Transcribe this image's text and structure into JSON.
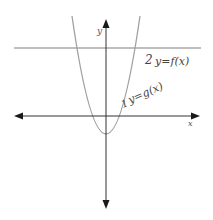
{
  "diagram": {
    "type": "graph-sketch",
    "axes": {
      "x_label": "x",
      "y_label": "y",
      "axis_color": "#222222"
    },
    "curves": [
      {
        "name": "f",
        "kind": "horizontal-line",
        "label": "y=f(x)",
        "marker": "2",
        "color": "#9a9a9a"
      },
      {
        "name": "g",
        "kind": "parabola-upward",
        "label": "y=g(x)",
        "marker": "1",
        "color": "#9a9a9a"
      }
    ]
  }
}
